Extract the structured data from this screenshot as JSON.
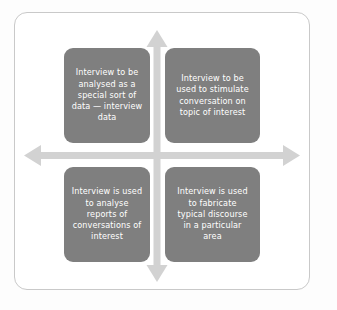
{
  "diagram": {
    "type": "2x2-quadrant-matrix",
    "colors": {
      "box_fill": "#7f7f7f",
      "box_text": "#ffffff",
      "arrow": "#d2d2d2",
      "frame_border": "#c9c9c9",
      "page_background": "#fdfdfd",
      "frame_background": "#ffffff"
    },
    "axes": {
      "vertical_arrow": "double-headed-vertical-arrow",
      "horizontal_arrow": "double-headed-horizontal-arrow"
    },
    "quadrants": [
      {
        "position": "top-left",
        "text": "Interview to be\nanalysed as a\nspecial sort of\ndata — interview\ndata"
      },
      {
        "position": "top-right",
        "text": "Interview to be\nused to stimulate\nconversation on\ntopic of interest"
      },
      {
        "position": "bottom-left",
        "text": "Interview is used\nto analyse\nreports of\nconversations of\ninterest"
      },
      {
        "position": "bottom-right",
        "text": "Interview is used\nto fabricate\ntypical discourse\nin a particular\narea"
      }
    ]
  }
}
